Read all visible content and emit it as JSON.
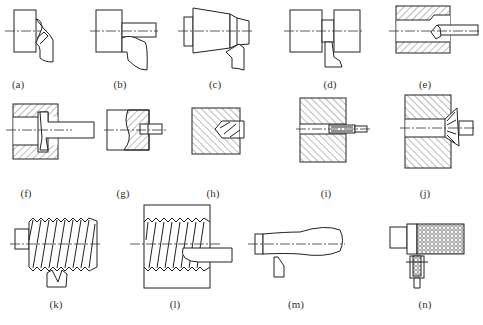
{
  "figure": {
    "colors": {
      "line": "#222222",
      "hatch": "#555555",
      "label": "#333333",
      "background": "#ffffff"
    },
    "panels": [
      {
        "id": "a",
        "label": "(a)",
        "operation": "facing",
        "label_x": 18,
        "label_y": 78
      },
      {
        "id": "b",
        "label": "(b)",
        "operation": "external turning",
        "label_x": 120,
        "label_y": 78
      },
      {
        "id": "c",
        "label": "(c)",
        "operation": "taper turning",
        "label_x": 215,
        "label_y": 78
      },
      {
        "id": "d",
        "label": "(d)",
        "operation": "grooving / parting",
        "label_x": 330,
        "label_y": 78
      },
      {
        "id": "e",
        "label": "(e)",
        "operation": "boring",
        "label_x": 425,
        "label_y": 78
      },
      {
        "id": "f",
        "label": "(f)",
        "operation": "internal grooving",
        "label_x": 26,
        "label_y": 187
      },
      {
        "id": "g",
        "label": "(g)",
        "operation": "center drilling",
        "label_x": 123,
        "label_y": 187
      },
      {
        "id": "h",
        "label": "(h)",
        "operation": "drilling",
        "label_x": 213,
        "label_y": 187
      },
      {
        "id": "i",
        "label": "(i)",
        "operation": "reaming",
        "label_x": 326,
        "label_y": 187
      },
      {
        "id": "j",
        "label": "(j)",
        "operation": "countersinking",
        "label_x": 425,
        "label_y": 187
      },
      {
        "id": "k",
        "label": "(k)",
        "operation": "external threading",
        "label_x": 56,
        "label_y": 298
      },
      {
        "id": "l",
        "label": "(l)",
        "operation": "internal threading",
        "label_x": 175,
        "label_y": 298
      },
      {
        "id": "m",
        "label": "(m)",
        "operation": "form turning",
        "label_x": 296,
        "label_y": 298
      },
      {
        "id": "n",
        "label": "(n)",
        "operation": "knurling",
        "label_x": 425,
        "label_y": 298
      }
    ]
  }
}
